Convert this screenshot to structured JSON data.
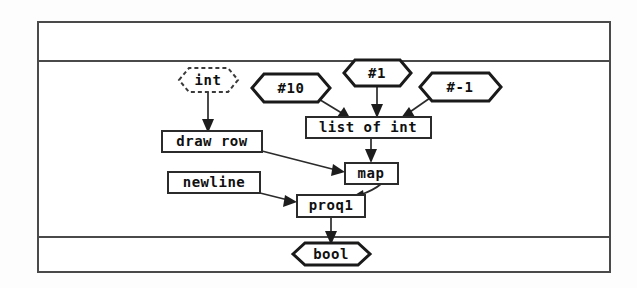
{
  "diagram": {
    "frame": {
      "border_color": "#4a4a4a",
      "background_color": "#ffffff"
    },
    "colors": {
      "node_stroke": "#1a1a1a",
      "box_stroke": "#2b2b2b",
      "edge": "#2b2b2b",
      "dashed_stroke": "#3a3a3a",
      "text": "#101010"
    },
    "bands": [
      {
        "name": "top-band",
        "label": ""
      },
      {
        "name": "main-band",
        "label": ""
      },
      {
        "name": "bottom-band",
        "label": ""
      }
    ],
    "nodes": [
      {
        "id": "int",
        "label": "int",
        "shape": "hexagon-dashed"
      },
      {
        "id": "num10",
        "label": "#10",
        "shape": "hexagon"
      },
      {
        "id": "num1",
        "label": "#1",
        "shape": "hexagon"
      },
      {
        "id": "numneg1",
        "label": "#-1",
        "shape": "hexagon"
      },
      {
        "id": "list-of-int",
        "label": "list of int",
        "shape": "rectangle"
      },
      {
        "id": "draw-row",
        "label": "draw row",
        "shape": "rectangle"
      },
      {
        "id": "map",
        "label": "map",
        "shape": "rectangle"
      },
      {
        "id": "newline",
        "label": "newline",
        "shape": "rectangle"
      },
      {
        "id": "proq1",
        "label": "proq1",
        "shape": "rectangle"
      },
      {
        "id": "bool",
        "label": "bool",
        "shape": "hexagon"
      }
    ],
    "edges": [
      {
        "from": "int",
        "to": "draw-row"
      },
      {
        "from": "num10",
        "to": "list-of-int"
      },
      {
        "from": "num1",
        "to": "list-of-int"
      },
      {
        "from": "numneg1",
        "to": "list-of-int"
      },
      {
        "from": "list-of-int",
        "to": "map"
      },
      {
        "from": "draw-row",
        "to": "map"
      },
      {
        "from": "map",
        "to": "proq1"
      },
      {
        "from": "newline",
        "to": "proq1"
      },
      {
        "from": "proq1",
        "to": "bool"
      }
    ]
  }
}
